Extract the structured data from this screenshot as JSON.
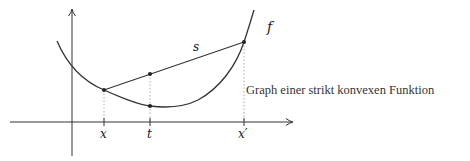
{
  "diagram": {
    "caption": "Graph einer strikt konvexen Funktion",
    "labels": {
      "function": "f",
      "secant": "s",
      "x_tick": "x",
      "t_tick": "t",
      "x_prime_tick": "x′"
    },
    "colors": {
      "stroke": "#333333",
      "guide": "#999999",
      "text": "#222222"
    },
    "elements": [
      "coordinate axes with arrows",
      "convex curve f",
      "secant line s from (x, f(x)) to (x′, f(x′))",
      "dotted vertical guides at x, t, x′",
      "points on curve and secant at t"
    ]
  }
}
